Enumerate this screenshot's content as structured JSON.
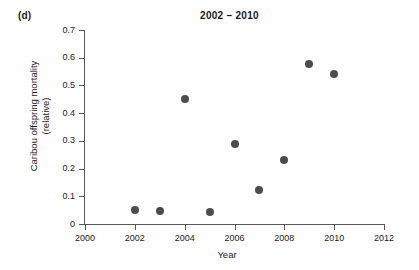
{
  "panel": {
    "label": "(d)"
  },
  "chart_data": {
    "type": "scatter",
    "title": "2002 – 2010",
    "xlabel": "Year",
    "ylabel_lines": [
      "Caribou offspring mortality",
      "(relative)"
    ],
    "ylabel": "Caribou offspring mortality (relative)",
    "xlim": [
      2000,
      2012
    ],
    "ylim": [
      0,
      0.7
    ],
    "xticks": [
      2000,
      2002,
      2004,
      2006,
      2008,
      2010,
      2012
    ],
    "xtick_labels": [
      "2000",
      "2002",
      "2004",
      "2006",
      "2008",
      "2010",
      "2012"
    ],
    "yticks": [
      0,
      0.1,
      0.2,
      0.3,
      0.4,
      0.5,
      0.6,
      0.7
    ],
    "ytick_labels": [
      "0",
      "0.1",
      "0.2",
      "0.3",
      "0.4",
      "0.5",
      "0.6",
      "0.7"
    ],
    "grid": false,
    "legend": false,
    "marker_color": "#4d4d4d",
    "marker_size_px": 8,
    "axis_color": "#58595b",
    "x": [
      2002,
      2003,
      2004,
      2005,
      2006,
      2007,
      2008,
      2009,
      2010
    ],
    "y": [
      0.05,
      0.047,
      0.451,
      0.042,
      0.289,
      0.123,
      0.231,
      0.577,
      0.541
    ],
    "points": [
      {
        "year": 2002,
        "value": 0.05
      },
      {
        "year": 2003,
        "value": 0.047
      },
      {
        "year": 2004,
        "value": 0.451
      },
      {
        "year": 2005,
        "value": 0.042
      },
      {
        "year": 2006,
        "value": 0.289
      },
      {
        "year": 2007,
        "value": 0.123
      },
      {
        "year": 2008,
        "value": 0.231
      },
      {
        "year": 2009,
        "value": 0.577
      },
      {
        "year": 2010,
        "value": 0.541
      }
    ]
  }
}
